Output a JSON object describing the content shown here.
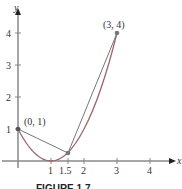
{
  "figure": {
    "caption": "FIGURE 1.7",
    "x_axis_label": "x",
    "y_axis_label": "y",
    "x_ticks": [
      "1",
      "1.5",
      "2",
      "3",
      "4"
    ],
    "y_ticks": [
      "1",
      "2",
      "3",
      "4"
    ],
    "points": [
      {
        "label": "(0, 1)",
        "x": 0,
        "y": 1
      },
      {
        "label": "(3, 4)",
        "x": 3,
        "y": 4
      }
    ],
    "curve": "y = (x - 1)^2",
    "secant_lines": [
      "(0,1)-(1.5,0.25)",
      "(1.5,0.25)-(3,4)"
    ],
    "colors": {
      "axis": "#888888",
      "curve": "#9b6a6a",
      "secant": "#777777",
      "point": "#555555"
    }
  }
}
